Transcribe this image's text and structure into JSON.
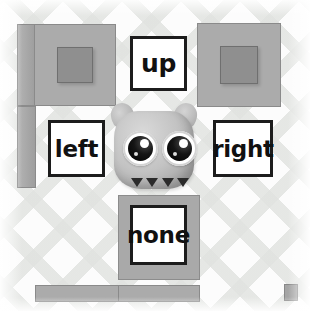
{
  "scene": {
    "title": "Direction control game scene",
    "background_pattern": "argyle-diamond-lattice",
    "background_color": "#fcfcfc"
  },
  "controls": {
    "up": {
      "label": "up"
    },
    "left": {
      "label": "left"
    },
    "right": {
      "label": "right"
    },
    "none": {
      "label": "none"
    }
  },
  "character": {
    "name": "gray-monster",
    "eye_count": 2,
    "tooth_count": 4,
    "body_color": "#c3c3c3",
    "pupil_color": "#151515",
    "tooth_color": "#2b2b2b"
  },
  "tiles": {
    "crate_color": "#ababab",
    "crate_inner_color": "#8f8f8f",
    "wall_color": "#a6a6a6",
    "floor_color": "#ababab",
    "outline_color": "#8a8a8a",
    "crate_top_left": "crate-tile",
    "crate_top_right": "crate-tile",
    "wall_left_upper": "wall-tile",
    "wall_left_lower": "wall-tile",
    "block_below_none": "block-tile",
    "floor_left": "floor-tile",
    "floor_center": "floor-tile",
    "marker_bottom_right": "small-block"
  }
}
